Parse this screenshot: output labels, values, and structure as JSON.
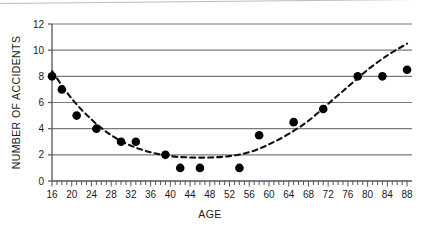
{
  "chart_data": {
    "type": "scatter",
    "title": "",
    "xlabel": "AGE",
    "ylabel": "NUMBER OF ACCIDENTS",
    "xlim": [
      16,
      89
    ],
    "ylim": [
      0,
      12
    ],
    "xticks": [
      16,
      20,
      24,
      28,
      32,
      36,
      40,
      44,
      48,
      52,
      56,
      60,
      64,
      68,
      72,
      76,
      80,
      84,
      88
    ],
    "yticks": [
      0,
      2,
      4,
      6,
      8,
      10,
      12
    ],
    "minor_x_tick_step": 1,
    "grid": "horizontal",
    "legend": "none",
    "marker": "filled-circle",
    "marker_color": "#000000",
    "grid_color": "#7a7a7a",
    "axis_color": "#555555",
    "trend_style": "dashed",
    "trend_label": "fitted quadratic trend curve",
    "x": [
      16,
      18,
      21,
      25,
      30,
      33,
      39,
      42,
      46,
      54,
      58,
      65,
      71,
      78,
      83,
      88
    ],
    "y": [
      8,
      7,
      5,
      4,
      3,
      3,
      2,
      1,
      1,
      1,
      3.5,
      4.5,
      5.5,
      8,
      8,
      8.5
    ],
    "series": [
      {
        "name": "Accidents by age",
        "points": [
          {
            "x": 16,
            "y": 8
          },
          {
            "x": 18,
            "y": 7
          },
          {
            "x": 21,
            "y": 5
          },
          {
            "x": 25,
            "y": 4
          },
          {
            "x": 30,
            "y": 3
          },
          {
            "x": 33,
            "y": 3
          },
          {
            "x": 39,
            "y": 2
          },
          {
            "x": 42,
            "y": 1
          },
          {
            "x": 46,
            "y": 1
          },
          {
            "x": 54,
            "y": 1
          },
          {
            "x": 58,
            "y": 3.5
          },
          {
            "x": 65,
            "y": 4.5
          },
          {
            "x": 71,
            "y": 5.5
          },
          {
            "x": 78,
            "y": 8
          },
          {
            "x": 83,
            "y": 8
          },
          {
            "x": 88,
            "y": 8.5
          }
        ]
      }
    ],
    "trend_points": [
      {
        "x": 16,
        "y": 8.4
      },
      {
        "x": 20,
        "y": 6.3
      },
      {
        "x": 24,
        "y": 4.7
      },
      {
        "x": 28,
        "y": 3.5
      },
      {
        "x": 32,
        "y": 2.7
      },
      {
        "x": 36,
        "y": 2.2
      },
      {
        "x": 40,
        "y": 1.9
      },
      {
        "x": 44,
        "y": 1.8
      },
      {
        "x": 48,
        "y": 1.8
      },
      {
        "x": 52,
        "y": 1.9
      },
      {
        "x": 56,
        "y": 2.2
      },
      {
        "x": 60,
        "y": 2.8
      },
      {
        "x": 64,
        "y": 3.6
      },
      {
        "x": 68,
        "y": 4.6
      },
      {
        "x": 72,
        "y": 5.9
      },
      {
        "x": 76,
        "y": 7.2
      },
      {
        "x": 80,
        "y": 8.5
      },
      {
        "x": 84,
        "y": 9.6
      },
      {
        "x": 88,
        "y": 10.5
      }
    ]
  }
}
